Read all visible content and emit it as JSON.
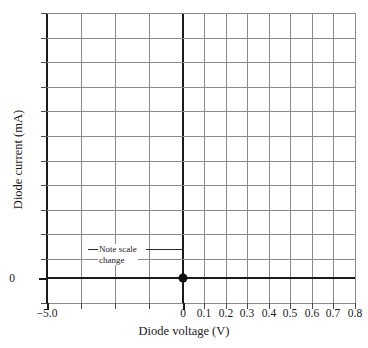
{
  "chart_data": {
    "type": "line",
    "title": "",
    "subtitle": "",
    "xlabel": "Diode voltage (V)",
    "ylabel": "Diode current (mA)",
    "grid": true,
    "legend": "none",
    "note": "Broken/compressed x-axis: negative region -5.0 V to 0 V is compressed into 4 cells; positive region 0 to 0.8 V uses 0.1 V per cell.",
    "x_ticks": [
      {
        "label": "−5.0",
        "px": 47,
        "value": -5.0,
        "major": true
      },
      {
        "label": "",
        "px": 81,
        "value": null,
        "major": false
      },
      {
        "label": "",
        "px": 115,
        "value": null,
        "major": false
      },
      {
        "label": "",
        "px": 149,
        "value": null,
        "major": false
      },
      {
        "label": "0",
        "px": 183,
        "value": 0.0,
        "major": true
      },
      {
        "label": "0.1",
        "px": 204,
        "value": 0.1,
        "major": false
      },
      {
        "label": "0.2",
        "px": 226,
        "value": 0.2,
        "major": false
      },
      {
        "label": "0.3",
        "px": 247,
        "value": 0.3,
        "major": false
      },
      {
        "label": "0.4",
        "px": 269,
        "value": 0.4,
        "major": false
      },
      {
        "label": "0.5",
        "px": 290,
        "value": 0.5,
        "major": false
      },
      {
        "label": "0.6",
        "px": 312,
        "value": 0.6,
        "major": false
      },
      {
        "label": "0.7",
        "px": 333,
        "value": 0.7,
        "major": false
      },
      {
        "label": "0.8",
        "px": 355,
        "value": 0.8,
        "major": false
      }
    ],
    "y_ticks": [
      {
        "label": "",
        "px": 13,
        "value": null,
        "major": false
      },
      {
        "label": "",
        "px": 38,
        "value": null,
        "major": false
      },
      {
        "label": "",
        "px": 62,
        "value": null,
        "major": false
      },
      {
        "label": "",
        "px": 87,
        "value": null,
        "major": false
      },
      {
        "label": "",
        "px": 111,
        "value": null,
        "major": false
      },
      {
        "label": "",
        "px": 136,
        "value": null,
        "major": false
      },
      {
        "label": "",
        "px": 161,
        "value": null,
        "major": false
      },
      {
        "label": "",
        "px": 185,
        "value": null,
        "major": false
      },
      {
        "label": "",
        "px": 210,
        "value": null,
        "major": false
      },
      {
        "label": "",
        "px": 234,
        "value": null,
        "major": false
      },
      {
        "label": "",
        "px": 259,
        "value": null,
        "major": false
      },
      {
        "label": "0",
        "px": 278,
        "value": 0,
        "major": true
      },
      {
        "label": "",
        "px": 303,
        "value": null,
        "major": false
      }
    ],
    "series": [
      {
        "name": "diode characteristic",
        "points": [
          {
            "x": 0.0,
            "y": 0,
            "px": 183,
            "py": 278
          }
        ],
        "marker": "filled-circle"
      }
    ],
    "annotations": [
      {
        "id": "scale-change-note",
        "text_line1": "Note scale",
        "text_line2": "change",
        "leader_left": true,
        "leader_right": true
      }
    ]
  },
  "axes": {
    "x_title": "Diode voltage (V)",
    "y_title": "Diode current (mA)"
  },
  "annotation": {
    "line1": "Note scale",
    "line2": "change"
  },
  "colors": {
    "grid": "#8a8a8a",
    "axis": "#1a1a1a",
    "text": "#1a1a1a",
    "marker": "#111111",
    "background": "#ffffff"
  }
}
